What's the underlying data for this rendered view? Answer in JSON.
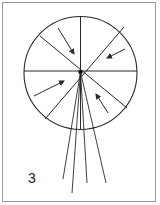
{
  "panel": {
    "label": "3"
  },
  "diagram": {
    "type": "wheel-with-converging-rays",
    "stroke_color": "#2a2a2a",
    "frame_color": "#9a9a9a",
    "circle": {
      "cx": 80.5,
      "cy": 73,
      "r": 56.5
    },
    "spokes": [
      {
        "x1": 80.5,
        "y1": 16.5,
        "x2": 80.5,
        "y2": 129.5
      },
      {
        "x1": 24,
        "y1": 71,
        "x2": 137,
        "y2": 71
      },
      {
        "x1": 40,
        "y1": 36,
        "x2": 127,
        "y2": 108
      },
      {
        "x1": 124,
        "y1": 27,
        "x2": 45,
        "y2": 119
      }
    ],
    "arrows": [
      {
        "name": "arrow-upper-left-sector",
        "x1": 58,
        "y1": 28,
        "x2": 74,
        "y2": 54
      },
      {
        "name": "arrow-upper-right-sector",
        "x1": 125,
        "y1": 49,
        "x2": 107,
        "y2": 58
      },
      {
        "name": "arrow-lower-left-sector",
        "x1": 34,
        "y1": 96,
        "x2": 64,
        "y2": 81
      },
      {
        "name": "arrow-lower-right-sector",
        "x1": 108,
        "y1": 113,
        "x2": 96,
        "y2": 94
      }
    ],
    "rays": [
      {
        "x1": 80.5,
        "y1": 72,
        "x2": 63,
        "y2": 179
      },
      {
        "x1": 80.5,
        "y1": 72,
        "x2": 72,
        "y2": 193
      },
      {
        "x1": 80.5,
        "y1": 72,
        "x2": 87,
        "y2": 183
      },
      {
        "x1": 80.5,
        "y1": 72,
        "x2": 106,
        "y2": 183
      }
    ]
  }
}
